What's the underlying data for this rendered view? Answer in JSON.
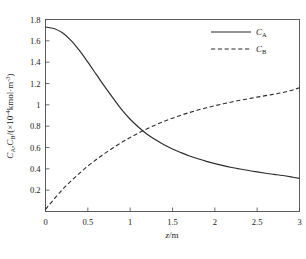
{
  "figure": {
    "background": "#ffffff",
    "line_color": "#2b2b2b",
    "axis_color": "#4d4d4d"
  },
  "axes": {
    "x": {
      "title": "z/m",
      "title_italic_part": "z",
      "title_rest": "/m",
      "min": 0,
      "max": 3,
      "ticks": [
        0,
        0.5,
        1,
        1.5,
        2,
        2.5,
        3
      ],
      "tick_labels": [
        "0",
        "0.5",
        "1",
        "1.5",
        "2",
        "2.5",
        "3"
      ]
    },
    "y": {
      "title": "CA,CB/(×10-4kmol·m-3)",
      "title_parts": {
        "c": "C",
        "sub_a": "A",
        "comma": ",",
        "sub_b": "B",
        "open": "/(",
        "times": "×",
        "ten": "10",
        "exp1": "-4",
        "unit": "kmol·m",
        "exp2": "-3",
        "close": ")"
      },
      "min": 0,
      "max": 1.8,
      "ticks": [
        0.2,
        0.4,
        0.6,
        0.8,
        1,
        1.2,
        1.4,
        1.6,
        1.8
      ],
      "tick_labels": [
        "0.2",
        "0.4",
        "0.6",
        "0.8",
        "1",
        "1.2",
        "1.4",
        "1.6",
        "1.8"
      ]
    }
  },
  "legend": {
    "position": "top-right",
    "entries": [
      {
        "label": "CA",
        "symbol": "C",
        "subscript": "A",
        "style": "solid",
        "key": "series_a"
      },
      {
        "label": "CB",
        "symbol": "C",
        "subscript": "B",
        "style": "dashed",
        "key": "series_b"
      }
    ]
  },
  "caption": {
    "text": ""
  },
  "chart_data": {
    "type": "line",
    "title": "",
    "xlabel": "z/m",
    "ylabel": "CA,CB/(×10-4kmol·m-3)",
    "xlim": [
      0,
      3
    ],
    "ylim": [
      0,
      1.8
    ],
    "grid": false,
    "legend_position": "top-right",
    "x": [
      0,
      0.1,
      0.2,
      0.3,
      0.4,
      0.5,
      0.6,
      0.7,
      0.8,
      0.9,
      1.0,
      1.1,
      1.2,
      1.3,
      1.4,
      1.5,
      1.6,
      1.7,
      1.8,
      1.9,
      2.0,
      2.1,
      2.2,
      2.3,
      2.4,
      2.5,
      2.6,
      2.7,
      2.8,
      2.9,
      3.0
    ],
    "series": [
      {
        "name": "CA",
        "style": "solid",
        "values": [
          1.73,
          1.715,
          1.675,
          1.605,
          1.51,
          1.4,
          1.285,
          1.17,
          1.06,
          0.955,
          0.865,
          0.79,
          0.725,
          0.672,
          0.626,
          0.586,
          0.552,
          0.521,
          0.494,
          0.47,
          0.449,
          0.43,
          0.413,
          0.398,
          0.384,
          0.371,
          0.359,
          0.348,
          0.337,
          0.324,
          0.31
        ]
      },
      {
        "name": "CB",
        "style": "dashed",
        "values": [
          0.02,
          0.115,
          0.205,
          0.285,
          0.358,
          0.425,
          0.487,
          0.545,
          0.598,
          0.648,
          0.694,
          0.737,
          0.776,
          0.812,
          0.845,
          0.875,
          0.903,
          0.928,
          0.951,
          0.972,
          0.992,
          1.01,
          1.027,
          1.043,
          1.058,
          1.072,
          1.086,
          1.1,
          1.115,
          1.135,
          1.16
        ]
      }
    ],
    "annotations": [
      {
        "type": "crossing",
        "x": 0.95,
        "y": 0.78
      }
    ]
  }
}
